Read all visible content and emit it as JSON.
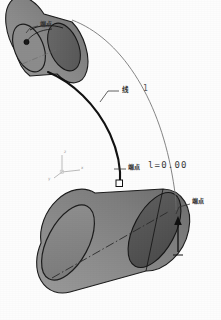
{
  "viewport": {
    "name": "cad-3d-viewport",
    "background": "#fdfdfd"
  },
  "colors": {
    "body_light": "#8c8c8c",
    "body_mid": "#7e7e7e",
    "body_dark": "#5c5c5c",
    "cap_dark": "#636363",
    "cap_darker": "#4e4e4e",
    "outline": "#1d1d1d",
    "curve_bold": "#121212",
    "curve_thin": "#6f6f6f",
    "leader": "#2d2d2d",
    "axis_triad": "#b3b3b3",
    "centerline": "#2a2a2a",
    "text": "#333333"
  },
  "objects": {
    "upper_cylinder": {
      "name": "upper-cylinder",
      "shading": "shaded-gray"
    },
    "lower_cylinder": {
      "name": "lower-cylinder",
      "shading": "shaded-gray"
    },
    "bold_curve": {
      "name": "cable-curve-bold"
    },
    "thin_curve": {
      "name": "cable-curve-thin"
    },
    "centerline": {
      "name": "center-axis-dashdot"
    }
  },
  "annotations": [
    {
      "id": "a1",
      "name": "endpoint-label-upper",
      "text": "端点",
      "x": 40,
      "y": 22,
      "type": "cjk"
    },
    {
      "id": "a2",
      "name": "line-label",
      "text": "线",
      "x": 122,
      "y": 90,
      "type": "line"
    },
    {
      "id": "a3",
      "name": "line-index",
      "text": "1",
      "x": 143,
      "y": 88,
      "type": "num"
    },
    {
      "id": "a4",
      "name": "endpoint-label-lower",
      "text": "端点",
      "x": 128,
      "y": 166,
      "type": "cjk"
    },
    {
      "id": "a5",
      "name": "endpoint-length-value",
      "text": "l=0.00",
      "x": 148,
      "y": 163,
      "type": "val"
    },
    {
      "id": "a6",
      "name": "endpoint-label-right",
      "text": "端点",
      "x": 192,
      "y": 199,
      "type": "cjk"
    }
  ],
  "axis_triad": {
    "name": "coordinate-triad",
    "x": 58,
    "y": 160,
    "labels": {
      "x": "x",
      "y": "y",
      "z": "z"
    }
  },
  "markers": {
    "endpoint_square": {
      "name": "endpoint-square-marker",
      "x": 76,
      "y": 182
    },
    "endpoint_upper": {
      "name": "endpoint-dot-marker",
      "x": 26,
      "y": 42
    },
    "arrow_right": {
      "name": "direction-arrow",
      "x": 178,
      "y": 228
    }
  }
}
